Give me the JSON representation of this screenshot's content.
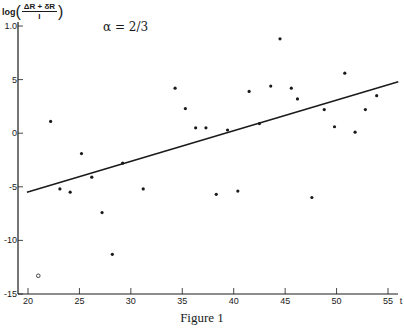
{
  "chart_data": {
    "type": "scatter",
    "title": "",
    "caption": "Figure 1",
    "annotation": "α = 2/3",
    "xlabel": "t",
    "ylabel": "log((ΔR + δR)/I)",
    "ylabel_parts": {
      "prefix": "log",
      "numerator": "ΔR + δR",
      "denominator": "I"
    },
    "xlim": [
      19,
      56
    ],
    "ylim": [
      -1.5,
      1.05
    ],
    "grid": false,
    "x_ticks": [
      20,
      25,
      30,
      35,
      40,
      45,
      50,
      55
    ],
    "x_tick_labels": [
      "20",
      "25",
      "30",
      "35",
      "40",
      "45",
      "50",
      "55"
    ],
    "y_ticks": [
      1.0,
      0.5,
      0,
      -0.5,
      -1.0,
      -1.5
    ],
    "y_tick_labels": [
      "1.0",
      "5",
      "0",
      "-5",
      "-10",
      "-15"
    ],
    "series": [
      {
        "name": "observations",
        "marker": "filled-dot",
        "points": [
          [
            22.2,
            0.11
          ],
          [
            23.1,
            -0.52
          ],
          [
            24.1,
            -0.55
          ],
          [
            25.2,
            -0.19
          ],
          [
            26.2,
            -0.41
          ],
          [
            27.2,
            -0.74
          ],
          [
            28.2,
            -1.13
          ],
          [
            29.2,
            -0.28
          ],
          [
            31.2,
            -0.52
          ],
          [
            34.3,
            0.42
          ],
          [
            35.3,
            0.23
          ],
          [
            36.3,
            0.05
          ],
          [
            37.3,
            0.05
          ],
          [
            38.3,
            -0.57
          ],
          [
            39.4,
            0.03
          ],
          [
            40.4,
            -0.54
          ],
          [
            41.5,
            0.39
          ],
          [
            42.5,
            0.09
          ],
          [
            43.6,
            0.44
          ],
          [
            44.5,
            0.88
          ],
          [
            45.6,
            0.42
          ],
          [
            46.2,
            0.32
          ],
          [
            47.6,
            -0.6
          ],
          [
            48.8,
            0.22
          ],
          [
            49.8,
            0.06
          ],
          [
            50.8,
            0.56
          ],
          [
            51.8,
            0.01
          ],
          [
            52.8,
            0.22
          ],
          [
            53.9,
            0.35
          ]
        ]
      },
      {
        "name": "outlier",
        "marker": "open-circle",
        "points": [
          [
            21.0,
            -1.33
          ]
        ]
      },
      {
        "name": "regression line",
        "type": "line",
        "points": [
          [
            19.9,
            -0.55
          ],
          [
            56.0,
            0.48
          ]
        ]
      }
    ]
  }
}
